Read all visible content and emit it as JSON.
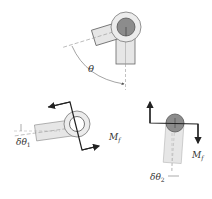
{
  "diagram": {
    "type": "mechanics-joint-rotation",
    "panels": [
      {
        "id": "top",
        "description": "Two links joined at a pin; upper link rotated by angle theta from vertical"
      },
      {
        "id": "bottom-left",
        "description": "Link 1 with open eye, small rotation delta-theta-1 and friction moment couple"
      },
      {
        "id": "bottom-right",
        "description": "Link 2 with pin, small rotation delta-theta-2 and friction moment couple"
      }
    ],
    "labels": {
      "theta": "θ",
      "delta_theta_1_main": "δθ",
      "delta_theta_1_sub": "1",
      "delta_theta_2_main": "δθ",
      "delta_theta_2_sub": "2",
      "moment_left_main": "M",
      "moment_left_sub": "f",
      "moment_right_main": "M",
      "moment_right_sub": "f"
    },
    "colors": {
      "link_fill": "#e6e6e6",
      "pin_fill": "#8c8c8c",
      "eye_fill": "#ececec",
      "stroke": "#555555",
      "arrow": "#222222"
    }
  }
}
